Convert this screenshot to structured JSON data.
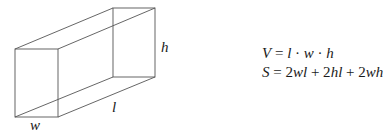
{
  "figure": {
    "labels": {
      "height": "h",
      "length": "l",
      "width": "w"
    },
    "formulas": {
      "volume": "V = l · w · h",
      "surface_area": "S = 2wl + 2hl + 2wh"
    },
    "line_color": "#555555"
  }
}
